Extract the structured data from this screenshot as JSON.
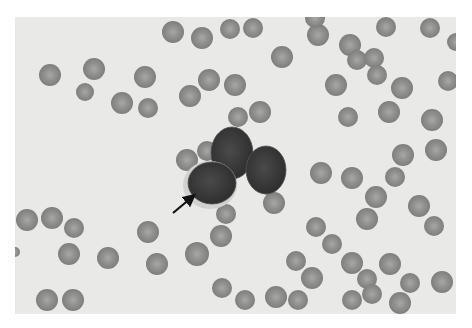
{
  "image": {
    "description": "Grayscale blood smear micrograph with a cluster of large dark-nucleated cells surrounded by red blood cells; an arrow points to one cell",
    "background": "#ffffff",
    "field": {
      "x": 15,
      "y": 17,
      "w": 441,
      "h": 297,
      "color": "#e9e9e7"
    }
  },
  "rbc_color": "#8a8a88",
  "rbc_light": "#a6a6a3",
  "rbcs": [
    [
      50,
      75,
      11
    ],
    [
      94,
      69,
      11
    ],
    [
      85,
      92,
      9
    ],
    [
      122,
      103,
      11
    ],
    [
      148,
      108,
      10
    ],
    [
      145,
      77,
      11
    ],
    [
      173,
      32,
      11
    ],
    [
      202,
      38,
      11
    ],
    [
      230,
      29,
      10
    ],
    [
      253,
      28,
      10
    ],
    [
      190,
      96,
      11
    ],
    [
      209,
      80,
      11
    ],
    [
      235,
      85,
      11
    ],
    [
      282,
      57,
      11
    ],
    [
      318,
      35,
      11
    ],
    [
      350,
      45,
      11
    ],
    [
      357,
      60,
      10
    ],
    [
      386,
      27,
      10
    ],
    [
      430,
      28,
      10
    ],
    [
      456,
      42,
      9
    ],
    [
      315,
      18,
      10
    ],
    [
      374,
      58,
      10
    ],
    [
      377,
      75,
      10
    ],
    [
      402,
      88,
      11
    ],
    [
      448,
      81,
      10
    ],
    [
      336,
      85,
      11
    ],
    [
      348,
      117,
      10
    ],
    [
      389,
      112,
      11
    ],
    [
      432,
      120,
      11
    ],
    [
      403,
      155,
      11
    ],
    [
      436,
      150,
      11
    ],
    [
      321,
      173,
      11
    ],
    [
      352,
      178,
      11
    ],
    [
      395,
      177,
      10
    ],
    [
      376,
      197,
      11
    ],
    [
      419,
      206,
      11
    ],
    [
      434,
      226,
      10
    ],
    [
      367,
      219,
      11
    ],
    [
      316,
      227,
      10
    ],
    [
      332,
      244,
      10
    ],
    [
      296,
      261,
      10
    ],
    [
      312,
      278,
      11
    ],
    [
      352,
      263,
      11
    ],
    [
      390,
      264,
      11
    ],
    [
      367,
      279,
      10
    ],
    [
      410,
      283,
      10
    ],
    [
      442,
      282,
      11
    ],
    [
      352,
      300,
      10
    ],
    [
      400,
      303,
      11
    ],
    [
      372,
      294,
      10
    ],
    [
      27,
      220,
      11
    ],
    [
      52,
      218,
      11
    ],
    [
      74,
      228,
      10
    ],
    [
      69,
      254,
      11
    ],
    [
      108,
      258,
      11
    ],
    [
      148,
      232,
      11
    ],
    [
      157,
      264,
      11
    ],
    [
      197,
      254,
      12
    ],
    [
      47,
      300,
      11
    ],
    [
      73,
      300,
      11
    ],
    [
      15,
      252,
      5
    ],
    [
      222,
      288,
      10
    ],
    [
      245,
      300,
      10
    ],
    [
      276,
      297,
      11
    ],
    [
      221,
      236,
      11
    ],
    [
      226,
      214,
      10
    ],
    [
      187,
      160,
      11
    ],
    [
      207,
      151,
      10
    ],
    [
      238,
      117,
      10
    ],
    [
      260,
      112,
      11
    ],
    [
      274,
      203,
      11
    ],
    [
      268,
      185,
      10
    ],
    [
      298,
      300,
      10
    ]
  ],
  "blasts": [
    {
      "cx": 232,
      "cy": 153,
      "rx": 21,
      "ry": 26,
      "color": "#3a3a3a"
    },
    {
      "cx": 266,
      "cy": 170,
      "rx": 20,
      "ry": 24,
      "color": "#3d3d3d"
    },
    {
      "cx": 212,
      "cy": 183,
      "rx": 24,
      "ry": 21,
      "color": "#3e3e3e",
      "halo": "#d2d2d0"
    }
  ],
  "arrow": {
    "x1": 173,
    "y1": 213,
    "x2": 191,
    "y2": 198,
    "color": "#111111",
    "label": "arrow pointing to cell"
  }
}
